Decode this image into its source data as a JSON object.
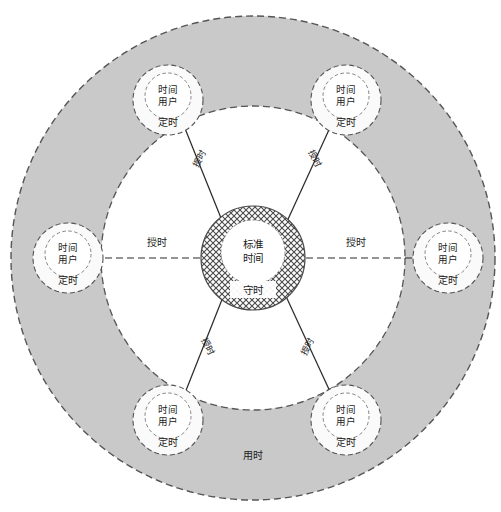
{
  "diagram": {
    "center": {
      "name": "standard-time-core",
      "line1": "标准",
      "line2": "时间",
      "sub": "守时",
      "fill_pattern": "crosshatch",
      "pattern_color": "#4a4a4a",
      "radius": 52,
      "inner_radius": 32
    },
    "rings": [
      {
        "name": "outer-usage-ring",
        "label": "用时",
        "fill": "#c9c9c9",
        "stroke": "#555555",
        "dash": true,
        "radius": 242
      },
      {
        "name": "inner-service-ring",
        "fill": "#ffffff",
        "stroke": "#555555",
        "dash": true,
        "radius": 152
      }
    ],
    "nodes": [
      {
        "id": "node-top-left",
        "line1": "时间",
        "line2": "用户",
        "sub": "定时",
        "angle_deg": 125,
        "cx": 168,
        "cy": 100
      },
      {
        "id": "node-top-right",
        "line1": "时间",
        "line2": "用户",
        "sub": "定时",
        "angle_deg": 55,
        "cx": 346,
        "cy": 100
      },
      {
        "id": "node-left",
        "line1": "时间",
        "line2": "用户",
        "sub": "定时",
        "angle_deg": 180,
        "cx": 68,
        "cy": 258
      },
      {
        "id": "node-right",
        "line1": "时间",
        "line2": "用户",
        "sub": "定时",
        "angle_deg": 0,
        "cx": 448,
        "cy": 258
      },
      {
        "id": "node-bottom-left",
        "line1": "时间",
        "line2": "用户",
        "sub": "定时",
        "angle_deg": 235,
        "cx": 168,
        "cy": 420
      },
      {
        "id": "node-bottom-right",
        "line1": "时间",
        "line2": "用户",
        "sub": "定时",
        "angle_deg": 305,
        "cx": 346,
        "cy": 420
      }
    ],
    "edges": [
      {
        "id": "edge-to-top-left",
        "label": "授时",
        "style": "solid",
        "from": "center",
        "to": "node-top-left",
        "label_x": 202,
        "label_y": 160,
        "rotate": -61
      },
      {
        "id": "edge-to-top-right",
        "label": "授时",
        "style": "solid",
        "from": "center",
        "to": "node-top-right",
        "label_x": 312,
        "label_y": 160,
        "rotate": 61
      },
      {
        "id": "edge-to-left",
        "label": "授时",
        "style": "dashed",
        "from": "center",
        "to": "node-left",
        "label_x": 157,
        "label_y": 243,
        "rotate": 0
      },
      {
        "id": "edge-to-right",
        "label": "授时",
        "style": "dashed",
        "from": "center",
        "to": "node-right",
        "label_x": 356,
        "label_y": 243,
        "rotate": 0
      },
      {
        "id": "edge-to-bottom-left",
        "label": "授时",
        "style": "solid",
        "from": "center",
        "to": "node-bottom-left",
        "label_x": 205,
        "label_y": 348,
        "rotate": 61
      },
      {
        "id": "edge-to-bottom-right",
        "label": "授时",
        "style": "solid",
        "from": "center",
        "to": "node-bottom-right",
        "label_x": 310,
        "label_y": 348,
        "rotate": -61
      }
    ],
    "ring_label": {
      "name": "usage-ring-label",
      "text": "用时",
      "x": 253,
      "y": 459
    },
    "colors": {
      "ring_fill": "#c9c9c9",
      "inner_fill": "#ffffff",
      "stroke": "#555555",
      "line": "#2b2b2b",
      "text": "#1a1a1a",
      "node_fill": "#fafafa"
    }
  }
}
